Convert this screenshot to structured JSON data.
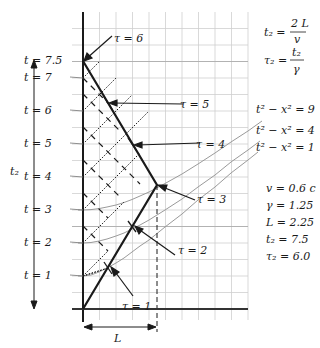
{
  "diagram": {
    "type": "spacetime-diagram",
    "t_axis_labels": [
      "t = 1",
      "t = 2",
      "t = 3",
      "t = 4",
      "t = 5",
      "t = 6",
      "t = 7",
      "t = 7.5"
    ],
    "t_axis_values": [
      1,
      2,
      3,
      4,
      5,
      6,
      7,
      7.5
    ],
    "tau_labels": [
      "τ = 1",
      "τ = 2",
      "τ = 3",
      "τ = 4",
      "τ = 5",
      "τ = 6"
    ],
    "side_labels": {
      "t2": "t₂",
      "L": "L"
    },
    "formulas": {
      "t2_lhs": "t₂ =",
      "t2_num": "2 L",
      "t2_den": "v",
      "tau2_lhs": "τ₂ =",
      "tau2_num": "t₂",
      "tau2_den": "γ"
    },
    "hyperbolas": [
      {
        "label": "t² − x² = 9",
        "k": 9
      },
      {
        "label": "t² − x² = 4",
        "k": 4
      },
      {
        "label": "t² − x² = 1",
        "k": 1
      }
    ],
    "parameters": [
      {
        "label": "v = 0.6 c"
      },
      {
        "label": "γ = 1.25"
      },
      {
        "label": "L = 2.25"
      },
      {
        "label": "t₂ = 7.5"
      },
      {
        "label": "τ₂ = 6.0"
      }
    ],
    "colors": {
      "axis": "#1a1a1a",
      "grid": "#c8c8c8",
      "worldline": "#1a1a1a",
      "hyperbola": "#9a9a9a"
    }
  }
}
